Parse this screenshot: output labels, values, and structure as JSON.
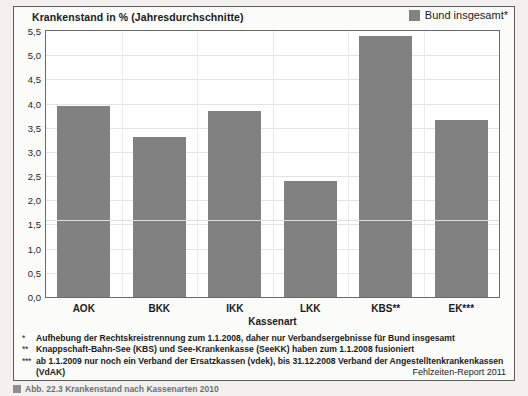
{
  "figure": {
    "title": "Krankenstand in %  (Jahresdurchschnitte)",
    "legend_label": "Bund insgesamt*",
    "legend_color": "#818181",
    "source": "Fehlzeiten-Report 2011",
    "caption": "Abb. 22.3 Krankenstand nach Kassenarten 2010"
  },
  "notes": [
    {
      "mark": "*",
      "text": "Aufhebung der Rechtskreistrennung zum 1.1.2008, daher nur Verbandsergebnisse für Bund insgesamt"
    },
    {
      "mark": "**",
      "text": "Knappschaft-Bahn-See (KBS) und See-Krankenkasse (SeeKK) haben zum 1.1.2008 fusioniert"
    },
    {
      "mark": "***",
      "text": "ab 1.1.2009 nur noch ein Verband der Ersatzkassen (vdek), bis 31.12.2008 Verband der Angestelltenkrankenkassen (VdAK)"
    }
  ],
  "chart_data": {
    "type": "bar",
    "title": "Krankenstand in %  (Jahresdurchschnitte)",
    "xlabel": "Kassenart",
    "ylabel": "",
    "categories": [
      "AOK",
      "BKK",
      "IKK",
      "LKK",
      "KBS**",
      "EK***"
    ],
    "values": [
      3.95,
      3.3,
      3.85,
      2.4,
      5.4,
      3.65
    ],
    "series": [
      {
        "name": "Krankenstand in %",
        "values": [
          3.95,
          3.3,
          3.85,
          2.4,
          5.4,
          3.65
        ]
      }
    ],
    "ylim": [
      0.0,
      5.5
    ],
    "ytick_labels": [
      "0,0",
      "0,5",
      "1,0",
      "1,5",
      "2,0",
      "2,5",
      "3,0",
      "3,5",
      "4,0",
      "4,5",
      "5,0",
      "5,5"
    ],
    "ytick_values": [
      0.0,
      0.5,
      1.0,
      1.5,
      2.0,
      2.5,
      3.0,
      3.5,
      4.0,
      4.5,
      5.0,
      5.5
    ],
    "grid": true,
    "legend_position": "top-right",
    "bar_color": "#818181",
    "reference_line": {
      "label": "Bund insgesamt*",
      "value": 1.6
    }
  }
}
